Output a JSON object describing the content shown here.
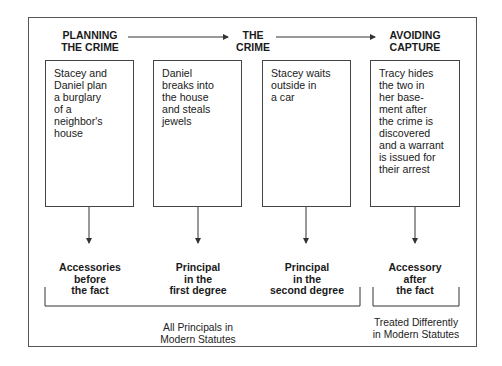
{
  "diagram": {
    "stages": [
      {
        "label": "PLANNING\nTHE CRIME"
      },
      {
        "label": "THE\nCRIME"
      },
      {
        "label": "AVOIDING\nCAPTURE"
      }
    ],
    "boxes": [
      {
        "text": "Stacey and\nDaniel plan\na burglary\nof a\nneighbor's\nhouse"
      },
      {
        "text": "Daniel\nbreaks into\nthe house\nand steals\njewels"
      },
      {
        "text": "Stacey waits\noutside in\na car"
      },
      {
        "text": "Tracy hides\nthe two in\nher base-\nment after\nthe crime is\ndiscovered\nand a warrant\nis issued for\ntheir arrest"
      }
    ],
    "roles": [
      {
        "label": "Accessories\nbefore\nthe fact"
      },
      {
        "label": "Principal\nin the\nfirst degree"
      },
      {
        "label": "Principal\nin the\nsecond degree"
      },
      {
        "label": "Accessory\nafter\nthe fact"
      }
    ],
    "groups": [
      {
        "label": "All Principals in\nModern Statutes"
      },
      {
        "label": "Treated Differently\nin Modern Statutes"
      }
    ],
    "colors": {
      "line": "#333333",
      "text": "#1a1a1a"
    }
  }
}
